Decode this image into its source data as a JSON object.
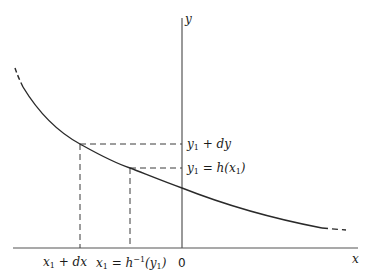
{
  "diagram": {
    "type": "function-graph",
    "axes": {
      "x_label": "x",
      "y_label": "y",
      "origin_label": "0"
    },
    "labels": {
      "y1_plus_dy": {
        "base": "y",
        "sub": "1",
        "rest": " + dy"
      },
      "y1_eq_h": {
        "base": "y",
        "sub": "1",
        "eq": " = h(x",
        "sub2": "1",
        "close": ")"
      },
      "x1_plus_dx": {
        "base": "x",
        "sub": "1",
        "rest": " + dx"
      },
      "x1_eq_hinv": {
        "base": "x",
        "sub": "1",
        "eq": " = h",
        "sup": "−1",
        "open": "(y",
        "sub2": "1",
        "close": ")"
      }
    },
    "colors": {
      "line": "#2a2a2a",
      "axis": "#555555",
      "dashed": "#3a3a3a"
    }
  }
}
